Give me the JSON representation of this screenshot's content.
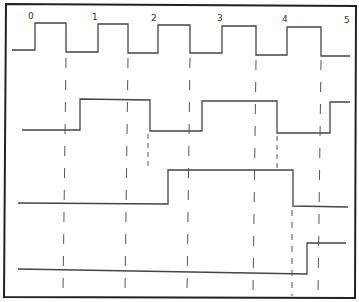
{
  "diagram": {
    "type": "timing-diagram",
    "clock_labels": [
      "0",
      "1",
      "2",
      "3",
      "4",
      "5"
    ],
    "signals": [
      {
        "name": "clock",
        "waveform": "square pulses, 5 full cycles"
      },
      {
        "name": "divide-by-2",
        "waveform": "low, high, low, high, low, high"
      },
      {
        "name": "divide-by-4",
        "waveform": "low, high, low"
      },
      {
        "name": "divide-by-8",
        "waveform": "low, high"
      }
    ],
    "colors": {
      "line": "#444444",
      "frame": "#222222",
      "background": "#ffffff"
    }
  }
}
